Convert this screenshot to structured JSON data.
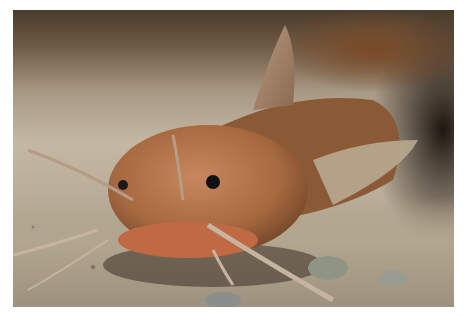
{
  "image": {
    "subject": "catfish",
    "description": "Close-up photograph of a brown catfish resting on sandy gravel, facing the camera with long barbels extended",
    "colors": {
      "background_dark": "#2a1d14",
      "body": "#a86a45",
      "body_highlight": "#c88760",
      "sand": "#bcae98",
      "eye": "#111111",
      "border": "#ffffff"
    }
  }
}
